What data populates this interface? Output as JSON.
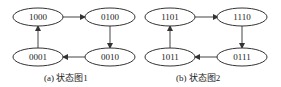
{
  "diagrams": [
    {
      "caption": "(a) 状态图1",
      "states": [
        "1000",
        "0100",
        "0010",
        "0001"
      ]
    },
    {
      "caption": "(b) 状态图2",
      "states": [
        "1101",
        "1110",
        "0111",
        "1011"
      ]
    }
  ],
  "colors": {
    "stroke": "#333333",
    "text": "#222222",
    "background": "#ffffff"
  }
}
